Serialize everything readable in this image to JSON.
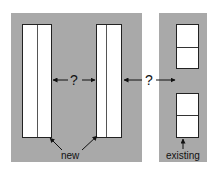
{
  "diagram": {
    "gap_label_1": "?",
    "gap_label_2": "?",
    "new_label": "new",
    "existing_label": "existing",
    "colors": {
      "panel_gray": "#a9a9a9",
      "box_fill": "#ffffff",
      "stroke": "#222222"
    }
  }
}
